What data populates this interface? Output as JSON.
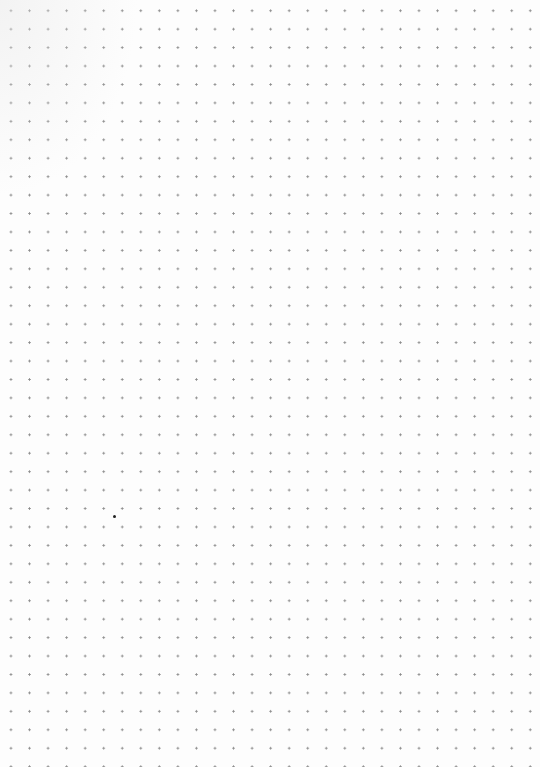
{
  "page": {
    "type": "dot-grid paper",
    "background_color": "#fdfdfd",
    "dot_color": "#8a8a8a",
    "grid_spacing_px": 18.5,
    "columns": 29,
    "rows": 41
  },
  "marks": [
    {
      "x": 113,
      "y": 515,
      "color": "#222222"
    }
  ]
}
